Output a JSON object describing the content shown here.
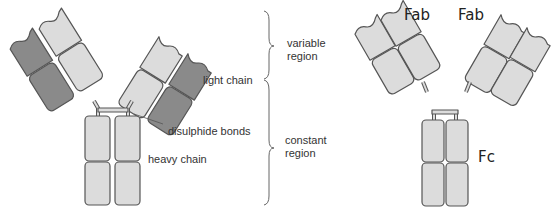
{
  "diagram": {
    "colors": {
      "light_domain": "#dcdcdc",
      "dark_domain": "#8a8a8a",
      "outline": "#555555",
      "bracket": "#666666",
      "text": "#333333"
    },
    "labels": {
      "light_chain": "light chain",
      "disulphide_bonds": "disulphide bonds",
      "heavy_chain": "heavy chain",
      "variable_region_1": "variable",
      "variable_region_2": "region",
      "constant_region_1": "constant",
      "constant_region_2": "region"
    },
    "fragments": {
      "fab_left": "Fab",
      "fab_right": "Fab",
      "fc": "Fc"
    }
  }
}
